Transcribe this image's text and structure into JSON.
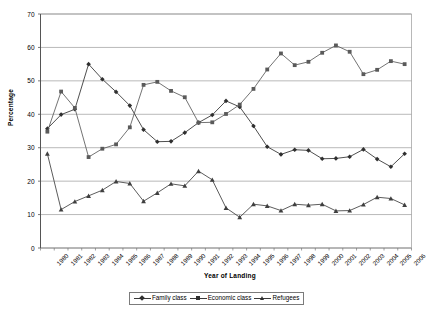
{
  "chart_data": {
    "type": "line",
    "title": "",
    "xlabel": "Year of Landing",
    "ylabel": "Percentage",
    "ylim": [
      0,
      70
    ],
    "yticks": [
      0,
      10,
      20,
      30,
      40,
      50,
      60,
      70
    ],
    "grid": true,
    "legend_position": "bottom",
    "categories": [
      "1980",
      "1981",
      "1982",
      "1983",
      "1984",
      "1985",
      "1986",
      "1987",
      "1988",
      "1989",
      "1990",
      "1991",
      "1992",
      "1993",
      "1994",
      "1995",
      "1996",
      "1997",
      "1998",
      "1999",
      "2000",
      "2001",
      "2002",
      "2003",
      "2004",
      "2005",
      "2006"
    ],
    "series": [
      {
        "name": "Family class",
        "marker": "diamond",
        "color": "#2f2f2f",
        "values": [
          35.7,
          39.9,
          41.5,
          55.0,
          50.5,
          46.7,
          42.6,
          35.4,
          31.8,
          31.9,
          34.5,
          37.5,
          39.8,
          44.0,
          42.2,
          36.5,
          30.3,
          28.0,
          29.4,
          29.2,
          26.7,
          26.8,
          27.3,
          29.5,
          26.6,
          24.3,
          28.2
        ]
      },
      {
        "name": "Economic class",
        "marker": "square",
        "color": "#5a5a5a",
        "values": [
          34.8,
          46.8,
          41.9,
          27.2,
          29.7,
          31.0,
          36.1,
          48.8,
          49.7,
          47.0,
          45.1,
          37.5,
          37.6,
          40.1,
          42.9,
          47.6,
          53.4,
          58.2,
          54.7,
          55.7,
          58.4,
          60.6,
          58.7,
          52.0,
          53.3,
          55.9,
          55.0
        ]
      },
      {
        "name": "Refugees",
        "marker": "triangle",
        "color": "#3f3f3f",
        "values": [
          28.2,
          11.5,
          13.9,
          15.6,
          17.3,
          19.9,
          19.3,
          14.0,
          16.5,
          19.2,
          18.6,
          23.0,
          20.4,
          12.0,
          9.2,
          13.1,
          12.6,
          11.2,
          13.1,
          12.8,
          13.1,
          11.1,
          11.2,
          13.0,
          15.2,
          14.8,
          12.9
        ]
      }
    ]
  },
  "legend": {
    "items": [
      {
        "label": "Family class",
        "marker": "diamond"
      },
      {
        "label": "Economic class",
        "marker": "square"
      },
      {
        "label": "Refugees",
        "marker": "triangle"
      }
    ]
  },
  "axes": {
    "y_title": "Percentage",
    "x_title": "Year of Landing"
  }
}
